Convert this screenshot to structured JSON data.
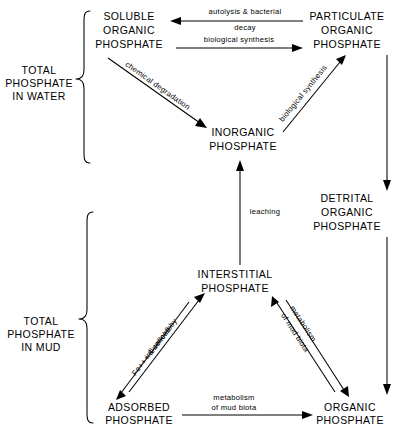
{
  "diagram": {
    "ink_color": "#000000",
    "background_color": "#ffffff",
    "nodes": [
      {
        "id": "soluble-organic-phosphate",
        "lines": [
          "SOLUBLE",
          "ORGANIC",
          "PHOSPHATE"
        ]
      },
      {
        "id": "particulate-organic-phosphate",
        "lines": [
          "PARTICULATE",
          "ORGANIC",
          "PHOSPHATE"
        ]
      },
      {
        "id": "inorganic-phosphate",
        "lines": [
          "INORGANIC",
          "PHOSPHATE"
        ]
      },
      {
        "id": "detrital-organic-phosphate",
        "lines": [
          "DETRITAL",
          "ORGANIC",
          "PHOSPHATE"
        ]
      },
      {
        "id": "interstitial-phosphate",
        "lines": [
          "INTERSTITIAL",
          "PHOSPHATE"
        ]
      },
      {
        "id": "adsorbed-phosphate",
        "lines": [
          "ADSORBED",
          "PHOSPHATE"
        ]
      },
      {
        "id": "organic-phosphate",
        "lines": [
          "ORGANIC",
          "PHOSPHATE"
        ]
      }
    ],
    "groups": [
      {
        "id": "total-phosphate-in-water",
        "lines": [
          "TOTAL",
          "PHOSPHATE",
          "IN  WATER"
        ]
      },
      {
        "id": "total-phosphate-in-mud",
        "lines": [
          "TOTAL",
          "PHOSPHATE",
          "IN  MUD"
        ]
      }
    ],
    "edges": [
      {
        "id": "autolysis-bacterial-decay",
        "from": "particulate-organic-phosphate",
        "to": "soluble-organic-phosphate",
        "lines": [
          "autolysis & bacterial",
          "decay"
        ]
      },
      {
        "id": "biological-synthesis-top",
        "from": "soluble-organic-phosphate",
        "to": "particulate-organic-phosphate",
        "lines": [
          "biological  synthesis"
        ]
      },
      {
        "id": "chemical-degradation",
        "from": "soluble-organic-phosphate",
        "to": "inorganic-phosphate",
        "lines": [
          "chemical  degradation"
        ]
      },
      {
        "id": "biological-synthesis-right",
        "from": "inorganic-phosphate",
        "to": "particulate-organic-phosphate",
        "lines": [
          "biological  synthesis"
        ]
      },
      {
        "id": "particulate-to-detrital",
        "from": "particulate-organic-phosphate",
        "to": "detrital-organic-phosphate",
        "lines": []
      },
      {
        "id": "leaching",
        "from": "interstitial-phosphate",
        "to": "inorganic-phosphate",
        "lines": [
          "leaching"
        ]
      },
      {
        "id": "influenced-by-fe-colloids",
        "from": "adsorbed-phosphate",
        "to": "interstitial-phosphate",
        "lines": [
          "influenced  by",
          "Fe+++ & colloids"
        ]
      },
      {
        "id": "metabolism-of-mud-biota-right",
        "from": "organic-phosphate",
        "to": "interstitial-phosphate",
        "lines": [
          "metabolism",
          "of  mud biota"
        ]
      },
      {
        "id": "metabolism-of-mud-biota-bottom",
        "from": "adsorbed-phosphate",
        "to": "organic-phosphate",
        "lines": [
          "metabolism",
          "of  mud biota"
        ]
      },
      {
        "id": "detrital-to-organic",
        "from": "detrital-organic-phosphate",
        "to": "organic-phosphate",
        "lines": []
      }
    ]
  }
}
